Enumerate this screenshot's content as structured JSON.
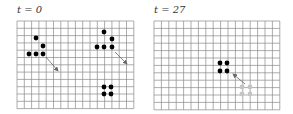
{
  "panels": [
    {
      "title": "t = 0",
      "grid": {
        "x": 17,
        "y": 21,
        "cols": 16,
        "rows": 12,
        "cell": 7.3
      },
      "cells_black": [
        [
          36,
          38
        ],
        [
          43,
          46
        ],
        [
          29,
          54
        ],
        [
          36,
          54
        ],
        [
          43,
          54
        ],
        [
          104,
          32
        ],
        [
          112,
          39
        ],
        [
          97,
          47
        ],
        [
          104,
          47
        ],
        [
          112,
          47
        ],
        [
          104,
          87
        ],
        [
          111,
          87
        ],
        [
          104,
          94
        ],
        [
          111,
          94
        ]
      ],
      "cells_gray": [],
      "arrows": [
        [
          46,
          57,
          58,
          71
        ],
        [
          115,
          52,
          127,
          64
        ]
      ]
    },
    {
      "title": "t = 27",
      "grid": {
        "x": 154,
        "y": 21,
        "cols": 17,
        "rows": 12,
        "cell": 7.4
      },
      "cells_black": [
        [
          220,
          63
        ],
        [
          227,
          63
        ],
        [
          220,
          71
        ],
        [
          227,
          71
        ]
      ],
      "cells_gray": [
        [
          242,
          87
        ],
        [
          250,
          87
        ],
        [
          242,
          94
        ],
        [
          250,
          94
        ]
      ],
      "arrows": [
        [
          245,
          84,
          233,
          74
        ]
      ]
    }
  ],
  "colors": {
    "grid": "#8a8a8a",
    "cell_black": "#000000",
    "cell_gray": "#c4c4c4",
    "arrow": "#666666"
  }
}
